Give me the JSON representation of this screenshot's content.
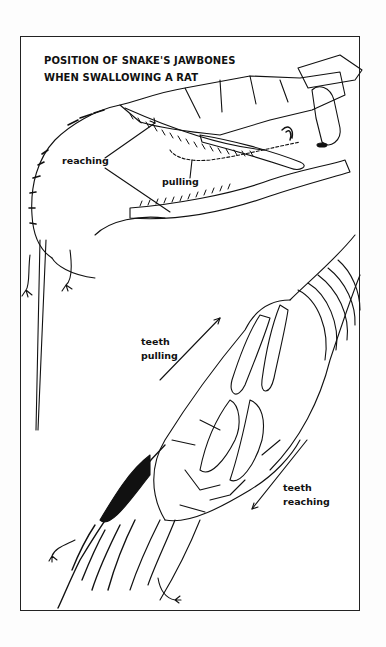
{
  "figure": {
    "title_line1": "POSITION OF SNAKE'S JAWBONES",
    "title_line2": "WHEN SWALLOWING A RAT",
    "top_illustration": {
      "subject": "snake skull jawbones engulfing rat head (side view)",
      "labels": {
        "reaching": "reaching",
        "pulling": "pulling"
      }
    },
    "bottom_illustration": {
      "subject": "snake head swallowing rat (top view)",
      "labels": {
        "teeth_pulling_1": "teeth",
        "teeth_pulling_2": "pulling",
        "teeth_reaching_1": "teeth",
        "teeth_reaching_2": "reaching"
      }
    }
  }
}
